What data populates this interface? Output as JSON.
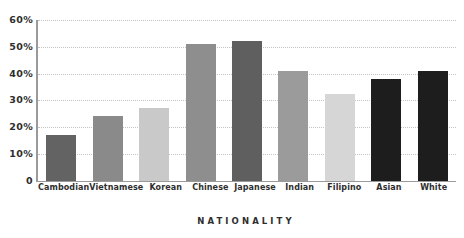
{
  "chart_data": {
    "type": "bar",
    "title": "",
    "subtitle": "",
    "xlabel": "NATIONALITY",
    "ylabel": "",
    "categories": [
      "Cambodian",
      "Vietnamese",
      "Korean",
      "Chinese",
      "Japanese",
      "Indian",
      "Filipino",
      "Asian",
      "White"
    ],
    "values": [
      17,
      24,
      27,
      51,
      52,
      41,
      32.5,
      38,
      41
    ],
    "bar_colors": [
      "#636363",
      "#8a8a8a",
      "#c9c9c9",
      "#8e8e8e",
      "#5f5f5f",
      "#9b9b9b",
      "#d6d6d6",
      "#1d1d1d",
      "#1d1d1d"
    ],
    "ylim": [
      0,
      60
    ],
    "ytick_values": [
      60,
      50,
      40,
      30,
      20,
      10,
      0
    ],
    "ytick_labels": [
      "60%",
      "50%",
      "40%",
      "30%",
      "20%",
      "10%",
      "0"
    ],
    "grid": true,
    "grid_style": "dotted",
    "grid_color": "#c4c4c4",
    "legend": false,
    "legend_position": "none",
    "axis_color": "#9a9a9a",
    "text_color": "#2e2e2e",
    "background": "#ffffff"
  }
}
